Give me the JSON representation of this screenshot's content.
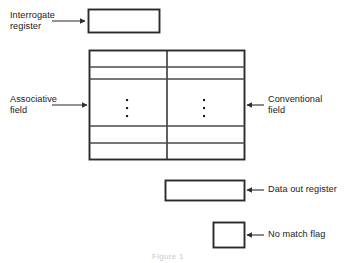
{
  "figure": {
    "title_caption": "Figure 1",
    "background_color": "#ffffff",
    "line_color": "#2b2b2b",
    "text_color": "#1a1a1a"
  },
  "labels": {
    "interrogate_register": "Interrogate\nregister",
    "associative_field": "Associative\nfield",
    "conventional_field": "Conventional\nfield",
    "data_out_register": "Data out register",
    "no_match_flag": "No match flag"
  },
  "boxes": {
    "interrogate_register": {
      "name": "Interrogate register",
      "x": 88,
      "y": 9,
      "width": 72,
      "height": 24
    },
    "memory_array": {
      "name": "Memory array",
      "x": 89,
      "y": 50,
      "width": 156,
      "height": 110,
      "column_divider_x": 167,
      "row_divider_y": [
        67,
        79,
        125,
        143
      ],
      "columns": [
        "Associative field",
        "Conventional field"
      ],
      "row_count": 5,
      "ellipsis_glyph": "vertical-ellipsis",
      "ellipsis_dots": 3
    },
    "data_out_register": {
      "name": "Data out register",
      "x": 165,
      "y": 180,
      "width": 80,
      "height": 21
    },
    "no_match_flag": {
      "name": "No match flag",
      "x": 213,
      "y": 222,
      "width": 32,
      "height": 26
    }
  },
  "leader_lines": [
    {
      "name": "interrogate-register-leader",
      "from_x": 50,
      "from_y": 21,
      "to_x": 88,
      "to_y": 21,
      "arrow": "right"
    },
    {
      "name": "associative-field-leader",
      "from_x": 50,
      "from_y": 105,
      "to_x": 89,
      "to_y": 105,
      "arrow": "right"
    },
    {
      "name": "conventional-field-leader",
      "from_x": 265,
      "from_y": 105,
      "to_x": 245,
      "to_y": 105,
      "arrow": "left"
    },
    {
      "name": "data-out-register-leader",
      "from_x": 265,
      "from_y": 190,
      "to_x": 245,
      "to_y": 190,
      "arrow": "left"
    },
    {
      "name": "no-match-flag-leader",
      "from_x": 265,
      "from_y": 235,
      "to_x": 245,
      "to_y": 235,
      "arrow": "left"
    }
  ],
  "label_positions": {
    "interrogate_register": {
      "x": 10,
      "y": 10
    },
    "associative_field": {
      "x": 10,
      "y": 94
    },
    "conventional_field": {
      "x": 268,
      "y": 94
    },
    "data_out_register": {
      "x": 268,
      "y": 184
    },
    "no_match_flag": {
      "x": 268,
      "y": 229
    },
    "caption": {
      "x": 152,
      "y": 252
    }
  }
}
